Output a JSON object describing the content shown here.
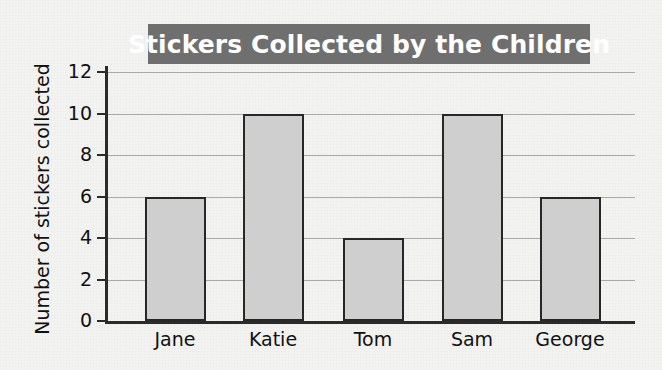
{
  "chart_data": {
    "type": "bar",
    "title": "Stickers Collected by the Children",
    "xlabel": "",
    "ylabel": "Number of stickers collected",
    "categories": [
      "Jane",
      "Katie",
      "Tom",
      "Sam",
      "George"
    ],
    "values": [
      6,
      10,
      4,
      10,
      6
    ],
    "ylim": [
      0,
      12
    ],
    "ytick_labels": [
      "0",
      "2",
      "4",
      "6",
      "8",
      "10",
      "12"
    ],
    "ytick_values": [
      0,
      2,
      4,
      6,
      8,
      10,
      12
    ],
    "grid": "horizontal",
    "legend": "none",
    "colors": {
      "bar_fill": "#cfcfcf",
      "bar_stroke": "#272727",
      "title_band": "#6f6f6f",
      "title_text": "#ffffff",
      "gridline": "#a9a9a9",
      "axis": "#2b2b2b",
      "background": "#f3f3f1"
    }
  }
}
